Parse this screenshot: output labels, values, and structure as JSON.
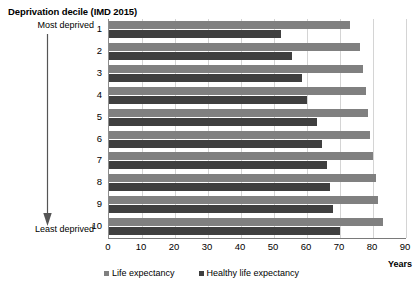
{
  "chart_data": {
    "type": "bar",
    "orientation": "horizontal",
    "title": "Deprivation decile (IMD 2015)",
    "xlabel": "Years",
    "ylabel": "",
    "xlim": [
      0,
      90
    ],
    "xticks": [
      0,
      10,
      20,
      30,
      40,
      50,
      60,
      70,
      80,
      90
    ],
    "grid": true,
    "legend_position": "bottom",
    "categories": [
      "1",
      "2",
      "3",
      "4",
      "5",
      "6",
      "7",
      "8",
      "9",
      "10"
    ],
    "category_annotations": {
      "top": "Most deprived",
      "bottom": "Least deprived"
    },
    "series": [
      {
        "name": "Life expectancy",
        "color": "#808080",
        "values": [
          73.0,
          76.0,
          77.0,
          78.0,
          78.5,
          79.0,
          80.0,
          81.0,
          81.5,
          83.0
        ]
      },
      {
        "name": "Healthy life expectancy",
        "color": "#3f3f3f",
        "values": [
          52.0,
          55.5,
          58.5,
          60.0,
          63.0,
          64.5,
          66.0,
          67.0,
          68.0,
          70.0
        ]
      }
    ]
  },
  "chart": {
    "title": "Deprivation decile (IMD 2015)",
    "most_deprived_label": "Most deprived",
    "least_deprived_label": "Least deprived",
    "years_axis_label": "Years",
    "arrow_icon": "down-arrow-icon"
  },
  "legend": {
    "items": [
      {
        "label": "Life expectancy",
        "color": "#808080"
      },
      {
        "label": "Healthy life expectancy",
        "color": "#3f3f3f"
      }
    ]
  },
  "x_axis": {
    "ticks": [
      "0",
      "10",
      "20",
      "30",
      "40",
      "50",
      "60",
      "70",
      "80",
      "90"
    ]
  },
  "y_axis": {
    "ticks": [
      "1",
      "2",
      "3",
      "4",
      "5",
      "6",
      "7",
      "8",
      "9",
      "10"
    ]
  }
}
